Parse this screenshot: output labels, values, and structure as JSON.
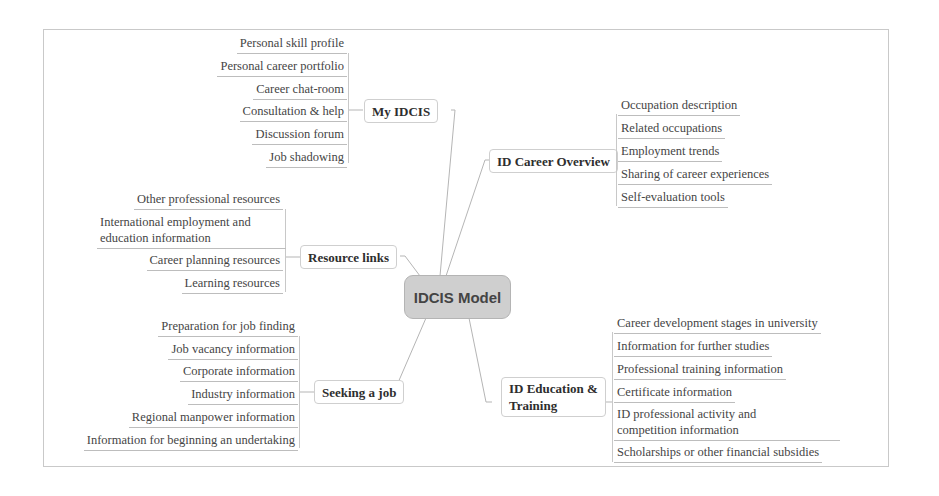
{
  "diagram": {
    "type": "mind-map",
    "central_topic": "IDCIS Model",
    "colors": {
      "central_fill": "#cfcfcf",
      "central_border": "#b4b4b4",
      "branch_border": "#cfcfcf",
      "connector": "#b5b5b5",
      "text": "#3a3a3a"
    },
    "branches": {
      "my_idcis": {
        "label": "My IDCIS",
        "children": [
          "Personal skill profile",
          "Personal career portfolio",
          "Career chat-room",
          "Consultation & help",
          "Discussion forum",
          "Job shadowing"
        ]
      },
      "resource_links": {
        "label": "Resource links",
        "children": [
          "Other professional resources",
          "International employment and education information",
          "Career planning resources",
          "Learning resources"
        ]
      },
      "seeking_a_job": {
        "label": "Seeking a job",
        "children": [
          "Preparation for job finding",
          "Job vacancy information",
          "Corporate information",
          "Industry information",
          "Regional manpower information",
          "Information for beginning an undertaking"
        ]
      },
      "id_career_overview": {
        "label": "ID Career Overview",
        "children": [
          "Occupation description",
          "Related occupations",
          "Employment trends",
          "Sharing of career experiences",
          "Self-evaluation tools"
        ]
      },
      "id_education_training": {
        "label_line1": "ID Education &",
        "label_line2": "Training",
        "children": [
          "Career development stages in university",
          "Information for further studies",
          "Professional training information",
          "Certificate information",
          "ID professional activity and competition information",
          "Scholarships or other financial subsidies"
        ]
      }
    },
    "split_labels": {
      "intl_line1": "International employment and",
      "intl_line2": "education information",
      "id_prof_line1": "ID professional activity and",
      "id_prof_line2": "competition information"
    }
  }
}
